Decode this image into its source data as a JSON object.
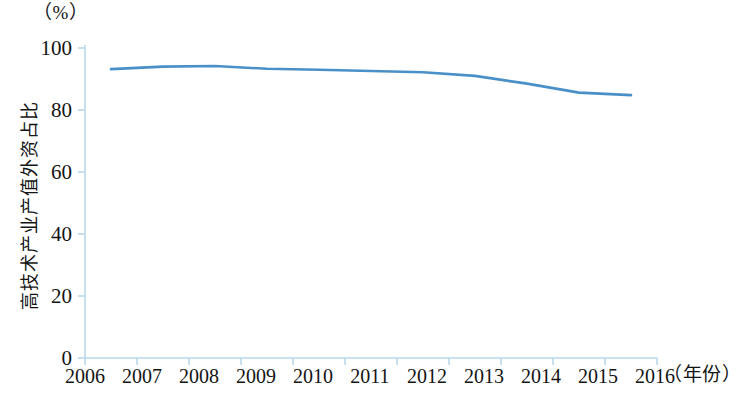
{
  "chart_data": {
    "type": "line",
    "title": "",
    "unit_label": "（%）",
    "ylabel": "高技术产业产值外资占比",
    "xlabel": "（年份）",
    "categories": [
      "2006",
      "2007",
      "2008",
      "2009",
      "2010",
      "2011",
      "2012",
      "2013",
      "2014",
      "2015",
      "2016"
    ],
    "series": [
      {
        "name": "高技术产业产值外资占比",
        "color": "#4a90c8",
        "values": [
          93.2,
          94.0,
          94.2,
          93.3,
          93.0,
          92.6,
          92.2,
          91.0,
          88.5,
          85.6,
          84.8
        ]
      }
    ],
    "ylim": [
      0,
      100
    ],
    "y_ticks": [
      "100",
      "80",
      "60",
      "40",
      "20",
      "0"
    ],
    "y_tick_values": [
      100,
      80,
      60,
      40,
      20,
      0
    ],
    "grid": false,
    "legend": "none",
    "axis_color": "#b9d9ea",
    "line_width": 2.6
  },
  "axes": {
    "y_axis_name": "y-axis",
    "x_axis_name": "x-axis"
  },
  "caption": {
    "bottom_partial_text": ""
  }
}
